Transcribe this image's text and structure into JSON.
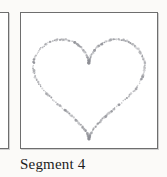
{
  "figure": {
    "background_color": "#fbfaf8",
    "panel_border_color": "#6e6e6e",
    "panel_fill_color": "#ffffff",
    "caption": "Segment 4",
    "caption_color": "#1c1c1c"
  },
  "panels": {
    "partial_left": {
      "label": "",
      "visible_fraction": "right edge only"
    },
    "main": {
      "label": "Segment 4",
      "contour_name": "heart-outline",
      "contour_style": "stippled",
      "contour_color": "#8f9096",
      "stipple_dot_count": 240
    }
  },
  "chart_data": {
    "type": "scatter",
    "title": "Segment 4",
    "xlabel": "",
    "ylabel": "",
    "xlim": [
      -1.15,
      1.15
    ],
    "ylim": [
      -1.25,
      1.05
    ],
    "grid": false,
    "legend": null,
    "series": [
      {
        "name": "heart-contour",
        "marker": "stipple-dot",
        "color": "#8f9096",
        "description": "Closed heart-shaped contour traced by densely packed scatter points",
        "parametric": {
          "x": "16 sin(t)^3 / 17",
          "y": "(13 cos(t) - 5 cos(2t) - 2 cos(3t) - cos(4t)) / 17",
          "t_range": [
            0,
            6.283185307179586
          ],
          "n_points": 240,
          "jitter": 0.018
        }
      }
    ]
  }
}
